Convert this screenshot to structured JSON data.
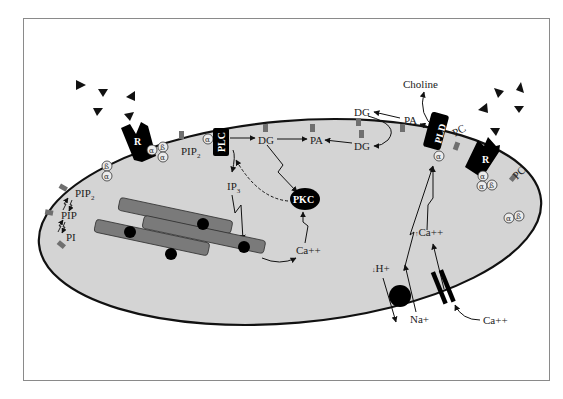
{
  "diagram": {
    "title": "",
    "colors": {
      "cell_fill": "#d4d4d4",
      "membrane": "#111111",
      "er_fill": "#7a7a7a",
      "lipid_marker": "#6f6f6f",
      "enzyme": "#000000",
      "frame": "#8a8a8a"
    },
    "labels": {
      "receptor_left": "R",
      "receptor_right": "R",
      "plc": "PLC",
      "pld": "PLD",
      "pkc": "PKC",
      "pip2_top": "PIP",
      "pip2_top_sub": "2",
      "dg_plc": "DG",
      "pa_mid": "PA",
      "dg_mid": "DG",
      "dg_top": "DG",
      "pa_top": "PA",
      "choline": "Choline",
      "pc_pld": "PC",
      "pc_right": "PC",
      "ip3": "IP",
      "ip3_sub": "3",
      "ca_er": "Ca++",
      "ca_in": "Ca++",
      "ca_in_arrow": "↑",
      "ca_out": "Ca++",
      "h_plus": "H+",
      "h_plus_arrow": "↓",
      "na_plus": "Na+",
      "pip2_left": "PIP",
      "pip2_left_sub": "2",
      "pip_left": "PIP",
      "pi_left": "PI"
    },
    "gprotein_subunits": {
      "alpha": "α",
      "beta": "ß"
    },
    "ligands": {
      "left_count": 5,
      "right_count": 5,
      "symbol": "triangle"
    }
  }
}
